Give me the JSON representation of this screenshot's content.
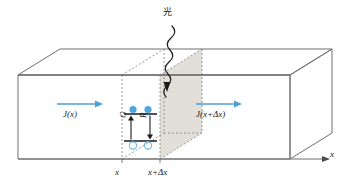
{
  "figure": {
    "type": "physics-schematic",
    "width": 350,
    "height": 189
  },
  "colors": {
    "outline": "#6e6e6e",
    "dashed": "#8a8a8a",
    "shaded_face": "#e2dfd9",
    "current_arrow": "#4d9fd6",
    "electron_fill": "#4da6e0",
    "hole_stroke": "#6fb8e6",
    "band_line": "#1a1a1a",
    "text": "#1a1a1a",
    "background": "#ffffff"
  },
  "labels": {
    "light": "光",
    "current_in": "J(x)",
    "current_out": "J(x+Δx)",
    "generation": "G",
    "recombination": "R",
    "tick_x": "x",
    "tick_x_plus_dx": "x+Δx",
    "axis_x": "x"
  },
  "icons": {
    "light_ray": "wavy-arrow-icon",
    "current_in_arrow": "right-arrow-icon",
    "current_out_arrow": "right-arrow-icon",
    "generation_arrow": "up-arrow-icon",
    "recombination_arrow": "down-arrow-icon",
    "axis_arrow": "right-arrow-icon",
    "electron": "filled-circle-icon",
    "hole": "open-circle-icon"
  },
  "elements": {
    "slab": "rectangular semiconductor block drawn in isometric projection",
    "slice": "differential volume element between x and x+Δx",
    "shaded_cross_section": "gray shaded plane at x+Δx",
    "band_diagram": {
      "conduction_band_carriers": 2,
      "valence_band_carriers": 2
    }
  }
}
